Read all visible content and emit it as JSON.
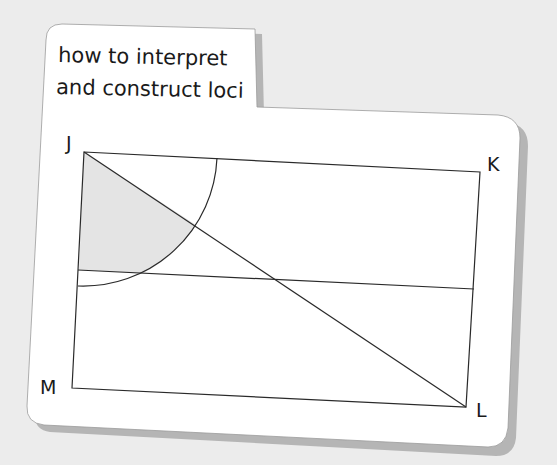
{
  "card": {
    "title_line1": "how to interpret",
    "title_line2": "and construct loci"
  },
  "diagram": {
    "vertices": {
      "J": "J",
      "K": "K",
      "L": "L",
      "M": "M"
    },
    "shape": "rectangle JKLM with diagonal JL, arc centred at J, and a line parallel to JK",
    "shaded_region": "region inside arc, above parallel line, below diagonal JL"
  },
  "colors": {
    "background": "#ececec",
    "card": "#ffffff",
    "card_shadow": "#b8b8b8",
    "line": "#2a2a2a",
    "shade": "#e6e6e6"
  }
}
